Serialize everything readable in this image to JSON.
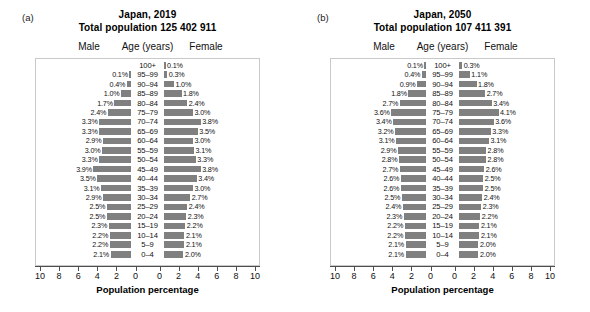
{
  "figure": {
    "axis_title": "Population percentage",
    "col_headers": {
      "male": "Male",
      "age": "Age (years)",
      "female": "Female"
    },
    "tick_labels_left": [
      "10",
      "8",
      "6",
      "4",
      "2",
      "0"
    ],
    "tick_labels_right": [
      "0",
      "2",
      "4",
      "6",
      "8",
      "10"
    ],
    "bar_color": "#808080",
    "frame_color": "#c9c9c9"
  },
  "panels": [
    {
      "tag": "(a)",
      "title_line1": "Japan, 2019",
      "title_line2": "Total population 125 402 911"
    },
    {
      "tag": "(b)",
      "title_line1": "Japan, 2050",
      "title_line2": "Total population 107 411 391"
    }
  ],
  "chart_data": [
    {
      "type": "bar",
      "orientation": "population-pyramid",
      "title": "Japan, 2019",
      "subtitle": "Total population 125 402 911",
      "panel": "(a)",
      "xlabel": "Population percentage",
      "ylabel": "Age (years)",
      "xlim": [
        0,
        10
      ],
      "xticks": [
        0,
        2,
        4,
        6,
        8,
        10
      ],
      "grid": false,
      "legend": "none",
      "categories": [
        "100+",
        "95–99",
        "90–94",
        "85–89",
        "80–84",
        "75–79",
        "70–74",
        "65–69",
        "60–64",
        "55–59",
        "50–54",
        "45–49",
        "40–44",
        "35–39",
        "30–34",
        "25–29",
        "20–24",
        "15–19",
        "10–14",
        "5–9",
        "0–4"
      ],
      "series": [
        {
          "name": "Male",
          "side": "left",
          "values": [
            null,
            0.1,
            0.4,
            1.0,
            1.7,
            2.4,
            3.3,
            3.3,
            2.9,
            3.0,
            3.3,
            3.9,
            3.5,
            3.1,
            2.9,
            2.5,
            2.5,
            2.3,
            2.2,
            2.2,
            2.1
          ],
          "labels": [
            "",
            "0.1%",
            "0.4%",
            "1.0%",
            "1.7%",
            "2.4%",
            "3.3%",
            "3.3%",
            "2.9%",
            "3.0%",
            "3.3%",
            "3.9%",
            "3.5%",
            "3.1%",
            "2.9%",
            "2.5%",
            "2.5%",
            "2.3%",
            "2.2%",
            "2.2%",
            "2.1%"
          ]
        },
        {
          "name": "Female",
          "side": "right",
          "values": [
            0.1,
            0.3,
            1.0,
            1.8,
            2.4,
            3.0,
            3.8,
            3.5,
            3.0,
            3.1,
            3.3,
            3.8,
            3.4,
            3.0,
            2.7,
            2.4,
            2.3,
            2.2,
            2.1,
            2.1,
            2.0
          ],
          "labels": [
            "0.1%",
            "0.3%",
            "1.0%",
            "1.8%",
            "2.4%",
            "3.0%",
            "3.8%",
            "3.5%",
            "3.0%",
            "3.1%",
            "3.3%",
            "3.8%",
            "3.4%",
            "3.0%",
            "2.7%",
            "2.4%",
            "2.3%",
            "2.2%",
            "2.1%",
            "2.1%",
            "2.0%"
          ]
        }
      ]
    },
    {
      "type": "bar",
      "orientation": "population-pyramid",
      "title": "Japan, 2050",
      "subtitle": "Total population 107 411 391",
      "panel": "(b)",
      "xlabel": "Population percentage",
      "ylabel": "Age (years)",
      "xlim": [
        0,
        10
      ],
      "xticks": [
        0,
        2,
        4,
        6,
        8,
        10
      ],
      "grid": false,
      "legend": "none",
      "categories": [
        "100+",
        "95–99",
        "90–94",
        "85–89",
        "80–84",
        "75–79",
        "70–74",
        "65–69",
        "60–64",
        "55–59",
        "50–54",
        "45–49",
        "40–44",
        "35–39",
        "30–34",
        "25–29",
        "20–24",
        "15–19",
        "10–14",
        "5–9",
        "0–4"
      ],
      "series": [
        {
          "name": "Male",
          "side": "left",
          "values": [
            0.1,
            0.4,
            0.9,
            1.8,
            2.7,
            3.6,
            3.4,
            3.2,
            3.1,
            2.9,
            2.8,
            2.7,
            2.6,
            2.6,
            2.5,
            2.4,
            2.3,
            2.2,
            2.2,
            2.1,
            2.1
          ],
          "labels": [
            "0.1%",
            "0.4%",
            "0.9%",
            "1.8%",
            "2.7%",
            "3.6%",
            "3.4%",
            "3.2%",
            "3.1%",
            "2.9%",
            "2.8%",
            "2.7%",
            "2.6%",
            "2.6%",
            "2.5%",
            "2.4%",
            "2.3%",
            "2.2%",
            "2.2%",
            "2.1%",
            "2.1%"
          ]
        },
        {
          "name": "Female",
          "side": "right",
          "values": [
            0.3,
            1.1,
            1.8,
            2.7,
            3.4,
            4.1,
            3.6,
            3.3,
            3.1,
            2.8,
            2.8,
            2.6,
            2.5,
            2.5,
            2.4,
            2.3,
            2.2,
            2.1,
            2.1,
            2.0,
            2.0
          ],
          "labels": [
            "0.3%",
            "1.1%",
            "1.8%",
            "2.7%",
            "3.4%",
            "4.1%",
            "3.6%",
            "3.3%",
            "3.1%",
            "2.8%",
            "2.8%",
            "2.6%",
            "2.5%",
            "2.5%",
            "2.4%",
            "2.3%",
            "2.2%",
            "2.1%",
            "2.1%",
            "2.0%",
            "2.0%"
          ]
        }
      ]
    }
  ]
}
